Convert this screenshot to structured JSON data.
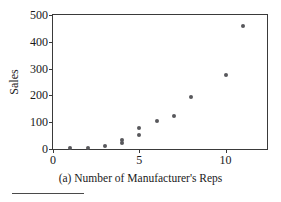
{
  "chart_data": {
    "type": "scatter",
    "title": "",
    "caption": "(a) Number of Manufacturer's Reps",
    "xlabel": "",
    "ylabel": "Sales",
    "xlim": [
      0,
      12.4
    ],
    "ylim": [
      0,
      500
    ],
    "xticks": [
      0,
      5,
      10
    ],
    "xtick_labels": [
      "0",
      "5",
      "10"
    ],
    "yticks": [
      0,
      100,
      200,
      300,
      400,
      500
    ],
    "ytick_labels": [
      "0",
      "100",
      "200",
      "300",
      "400",
      "500"
    ],
    "grid": false,
    "legend": false,
    "marker_color": "#58585c",
    "frame_color": "#3a3a3a",
    "background": "#ffffff",
    "points": [
      {
        "x": 1,
        "y": 3
      },
      {
        "x": 2,
        "y": 4
      },
      {
        "x": 3,
        "y": 11
      },
      {
        "x": 4,
        "y": 23
      },
      {
        "x": 4,
        "y": 32
      },
      {
        "x": 5,
        "y": 53
      },
      {
        "x": 5,
        "y": 80
      },
      {
        "x": 6,
        "y": 106
      },
      {
        "x": 7,
        "y": 125
      },
      {
        "x": 8,
        "y": 194
      },
      {
        "x": 10,
        "y": 277
      },
      {
        "x": 11,
        "y": 459
      }
    ]
  },
  "footnote": {
    "rule": true
  }
}
